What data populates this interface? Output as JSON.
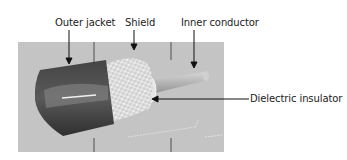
{
  "diagram": {
    "type": "labeled-illustration",
    "labels": {
      "outer_jacket": "Outer jacket",
      "shield": "Shield",
      "inner_conductor": "Inner conductor",
      "dielectric_insulator": "Dielectric insulator"
    }
  },
  "colors": {
    "background_panel": "#c4c4c4",
    "jacket": "#3a3a3a",
    "shield": "#e8e8e8",
    "conductor": "#b8b8b8",
    "line": "#111111"
  }
}
